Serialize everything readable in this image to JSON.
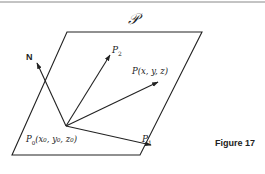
{
  "figure": {
    "caption": "Figure 17",
    "plane_label": "𝒫",
    "normal_label": "N",
    "vectors": [
      {
        "name": "normal",
        "label": "N"
      },
      {
        "name": "p2",
        "label": "P",
        "sub": "2"
      },
      {
        "name": "p",
        "label": "P(x, y, z)"
      },
      {
        "name": "p1",
        "label": "P",
        "sub": "1"
      }
    ],
    "origin_label": "P",
    "origin_sub": "0",
    "origin_coords": "(x",
    "origin_coords_full": "(x₀, y₀, z₀)",
    "p_label": "P(x, y, z)",
    "p1_label": "P",
    "p1_sub": "1",
    "p2_label": "P",
    "p2_sub": "2"
  },
  "colors": {
    "ink": "#222222",
    "rule": "#888888",
    "background": "#ffffff"
  }
}
